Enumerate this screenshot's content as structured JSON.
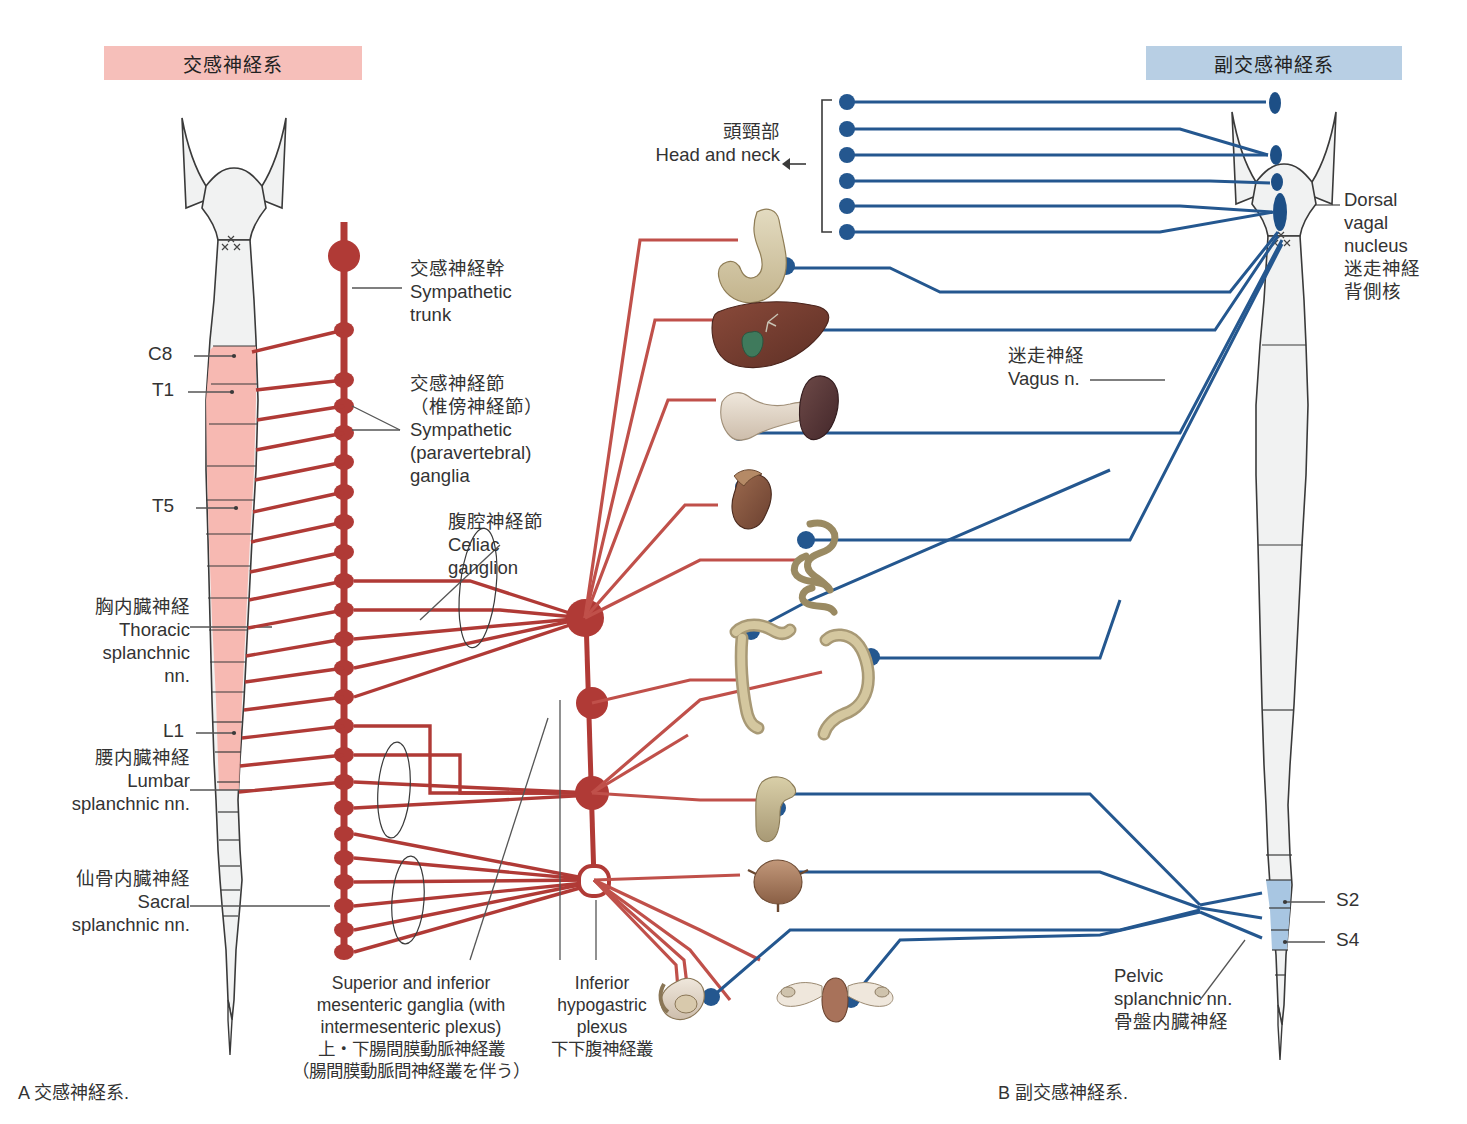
{
  "figure": {
    "panel_a_caption": "A 交感神経系.",
    "panel_b_caption": "B 副交感神経系."
  },
  "headers": {
    "sympathetic": "交感神経系",
    "parasympathetic": "副交感神経系",
    "sympathetic_bg": "#f6bfba",
    "parasympathetic_bg": "#b8cfe4"
  },
  "colors": {
    "sympathetic_red": "#b03a36",
    "parasympathetic_blue": "#24578f",
    "cord_fill": "#f1f2f2",
    "cord_outline": "#3a3a3a",
    "cord_red_fill": "#f7b5ae",
    "cord_blue_fill": "#a8c6e2",
    "leader_gray": "#555555"
  },
  "sympathetic_labels": {
    "trunk": "交感神経幹\nSympathetic\ntrunk",
    "ganglia": "交感神経節\n（椎傍神経節）\nSympathetic\n(paravertebral)\nganglia",
    "celiac": "腹腔神経節\nCeliac\nganglion",
    "thoracic": "胸内臓神経\nThoracic\nsplanchnic\nnn.",
    "lumbar": "腰内臓神経\nLumbar\nsplanchnic nn.",
    "sacral": "仙骨内臓神経\nSacral\nsplanchnic nn.",
    "mesenteric": "Superior and inferior\nmesenteric ganglia (with\nintermesenteric plexus)\n上・下腸間膜動脈神経叢\n（腸間膜動脈間神経叢を伴う）",
    "hypogastric": "Inferior\nhypogastric\nplexus\n下下腹神経叢"
  },
  "parasympathetic_labels": {
    "head_and_neck": "頭頸部\nHead and neck",
    "vagus": "迷走神経\nVagus n.",
    "dorsal_vagal_nucleus": "Dorsal\nvagal\nnucleus\n迷走神経\n背側核",
    "pelvic": "Pelvic\nsplanchnic nn.\n骨盤内臓神経"
  },
  "spinal_segments_left": [
    {
      "id": "C8",
      "label": "C8",
      "y": 355
    },
    {
      "id": "T1",
      "label": "T1",
      "y": 392
    },
    {
      "id": "T5",
      "label": "T5",
      "y": 508
    },
    {
      "id": "L1",
      "label": "L1",
      "y": 733
    }
  ],
  "spinal_segments_right": [
    {
      "id": "S2",
      "label": "S2",
      "y": 902
    },
    {
      "id": "S4",
      "label": "S4",
      "y": 942
    }
  ],
  "organs": [
    {
      "name": "stomach",
      "label": "stomach",
      "x": 735,
      "y": 215,
      "w": 95,
      "h": 90
    },
    {
      "name": "liver-gallbladder",
      "label": "liver and gallbladder",
      "x": 716,
      "y": 300,
      "w": 120,
      "h": 75
    },
    {
      "name": "pancreas-spleen",
      "label": "pancreas and spleen",
      "x": 718,
      "y": 372,
      "w": 140,
      "h": 75
    },
    {
      "name": "kidney",
      "label": "kidney",
      "x": 718,
      "y": 470,
      "w": 85,
      "h": 60
    },
    {
      "name": "small-intestine",
      "label": "small intestine",
      "x": 798,
      "y": 520,
      "w": 85,
      "h": 85
    },
    {
      "name": "ascending-colon",
      "label": "ascending colon",
      "x": 730,
      "y": 625,
      "w": 80,
      "h": 95
    },
    {
      "name": "descending-colon",
      "label": "descending colon",
      "x": 820,
      "y": 640,
      "w": 85,
      "h": 95
    },
    {
      "name": "rectum",
      "label": "rectum",
      "x": 758,
      "y": 775,
      "w": 60,
      "h": 70
    },
    {
      "name": "urinary-bladder",
      "label": "urinary bladder",
      "x": 752,
      "y": 858,
      "w": 60,
      "h": 55
    },
    {
      "name": "male-genitalia",
      "label": "male genitalia",
      "x": 663,
      "y": 968,
      "w": 70,
      "h": 58
    },
    {
      "name": "female-genitalia",
      "label": "female genitalia",
      "x": 775,
      "y": 968,
      "w": 110,
      "h": 58
    }
  ],
  "sympathetic_trunk": {
    "top_y": 220,
    "bottom_y": 955,
    "x": 344,
    "ganglion_count": 24
  },
  "prevertebral_ganglia": [
    {
      "name": "celiac-ganglion",
      "x": 585,
      "y": 618,
      "r": 19,
      "filled": true
    },
    {
      "name": "superior-mesenteric-ganglion",
      "x": 592,
      "y": 703,
      "r": 16,
      "filled": true
    },
    {
      "name": "inferior-mesenteric-ganglion",
      "x": 592,
      "y": 793,
      "r": 17,
      "filled": true
    },
    {
      "name": "inferior-hypogastric-plexus",
      "x": 594,
      "y": 880,
      "r": 14,
      "filled": false
    }
  ],
  "head_neck_outflow_count": 6,
  "brainstem_nuclei": [
    "edinger-westphal",
    "superior-salivatory",
    "inferior-salivatory",
    "dorsal-vagal-nucleus"
  ]
}
